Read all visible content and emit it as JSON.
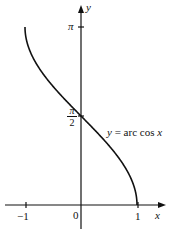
{
  "chart_data": {
    "type": "line",
    "title": "",
    "xlabel": "x",
    "ylabel": "y",
    "xlim": [
      -1,
      1
    ],
    "ylim": [
      0,
      3.14159
    ],
    "grid": false,
    "legend": null,
    "x_ticks": [
      {
        "value": -1,
        "label": "−1"
      },
      {
        "value": 0,
        "label": "0"
      },
      {
        "value": 1,
        "label": "1"
      }
    ],
    "y_ticks": [
      {
        "value": 1.5708,
        "label": "π/2"
      },
      {
        "value": 3.14159,
        "label": "π"
      }
    ],
    "series": [
      {
        "name": "y = arc cos x",
        "x": [
          -1,
          -0.9,
          -0.75,
          -0.5,
          -0.25,
          0,
          0.25,
          0.5,
          0.75,
          0.9,
          1
        ],
        "y": [
          3.1416,
          2.6906,
          2.4189,
          2.0944,
          1.8235,
          1.5708,
          1.3181,
          1.0472,
          0.7227,
          0.451,
          0
        ]
      }
    ],
    "annotations": [
      {
        "text": "y = arc cos x",
        "x": 0.25,
        "y": 1.5
      }
    ]
  },
  "labels": {
    "x_axis": "x",
    "y_axis": "y",
    "pi": "π",
    "pi_half_num": "π",
    "pi_half_den": "2",
    "tick_neg1": "−1",
    "tick_0": "0",
    "tick_1": "1",
    "curve_y": "y",
    "curve_eq": " = arc cos ",
    "curve_x": "x"
  }
}
